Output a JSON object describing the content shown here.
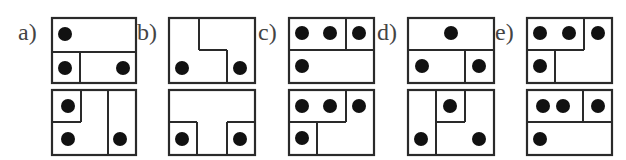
{
  "options": [
    {
      "label": "a)",
      "top": {
        "lines": [
          [
            0,
            34,
            84,
            34
          ],
          [
            28,
            34,
            28,
            65
          ]
        ],
        "dots": [
          [
            13,
            16
          ],
          [
            13,
            50
          ],
          [
            71,
            50
          ]
        ]
      },
      "bottom": {
        "lines": [
          [
            0,
            32,
            29,
            32
          ],
          [
            29,
            0,
            29,
            32
          ],
          [
            56,
            0,
            56,
            65
          ]
        ],
        "dots": [
          [
            16,
            16
          ],
          [
            16,
            49
          ],
          [
            68,
            49
          ]
        ]
      }
    },
    {
      "label": "b)",
      "top": {
        "lines": [
          [
            30,
            0,
            30,
            32
          ],
          [
            30,
            32,
            58,
            32
          ],
          [
            58,
            32,
            58,
            64
          ]
        ],
        "dots": [
          [
            13,
            50
          ],
          [
            71,
            50
          ]
        ]
      },
      "bottom": {
        "lines": [
          [
            0,
            32,
            28,
            32
          ],
          [
            28,
            32,
            28,
            65
          ],
          [
            58,
            32,
            86,
            32
          ],
          [
            58,
            32,
            58,
            65
          ]
        ],
        "dots": [
          [
            13,
            49
          ],
          [
            71,
            49
          ]
        ]
      }
    },
    {
      "label": "c)",
      "top": {
        "lines": [
          [
            0,
            32,
            85,
            32
          ],
          [
            57,
            0,
            57,
            32
          ]
        ],
        "dots": [
          [
            13,
            15
          ],
          [
            41,
            15
          ],
          [
            70,
            15
          ],
          [
            13,
            48
          ]
        ]
      },
      "bottom": {
        "lines": [
          [
            0,
            32,
            57,
            32
          ],
          [
            57,
            0,
            57,
            32
          ],
          [
            28,
            32,
            28,
            65
          ]
        ],
        "dots": [
          [
            13,
            16
          ],
          [
            41,
            16
          ],
          [
            70,
            16
          ],
          [
            13,
            48
          ]
        ]
      }
    },
    {
      "label": "d)",
      "top": {
        "lines": [
          [
            0,
            32,
            86,
            32
          ],
          [
            57,
            32,
            57,
            64
          ]
        ],
        "dots": [
          [
            43,
            15
          ],
          [
            14,
            48
          ],
          [
            71,
            48
          ]
        ]
      },
      "bottom": {
        "lines": [
          [
            28,
            0,
            28,
            65
          ],
          [
            28,
            32,
            57,
            32
          ],
          [
            57,
            0,
            57,
            32
          ]
        ],
        "dots": [
          [
            42,
            16
          ],
          [
            13,
            49
          ],
          [
            71,
            49
          ]
        ]
      }
    },
    {
      "label": "e)",
      "top": {
        "lines": [
          [
            0,
            32,
            57,
            32
          ],
          [
            57,
            0,
            57,
            32
          ],
          [
            28,
            32,
            28,
            64
          ]
        ],
        "dots": [
          [
            13,
            15
          ],
          [
            42,
            15
          ],
          [
            71,
            15
          ],
          [
            13,
            48
          ]
        ]
      },
      "bottom": {
        "lines": [
          [
            0,
            32,
            85,
            32
          ],
          [
            56,
            0,
            56,
            32
          ]
        ],
        "dots": [
          [
            16,
            16
          ],
          [
            36,
            16
          ],
          [
            71,
            16
          ],
          [
            13,
            49
          ]
        ]
      }
    }
  ],
  "layout": {
    "label_x": [
      18,
      137,
      258,
      377,
      495
    ],
    "box_x": [
      52,
      169,
      289,
      408,
      527
    ],
    "box_w": [
      84,
      86,
      85,
      86,
      85
    ],
    "top_y": 18,
    "bottom_y": 90,
    "box_h": 65,
    "dot_r": 7
  }
}
